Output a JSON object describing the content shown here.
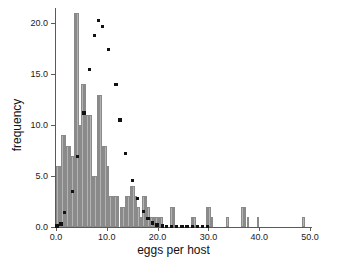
{
  "chart_data": {
    "type": "bar",
    "title": "",
    "subtitle": "",
    "xlabel": "eggs per host",
    "ylabel": "frequency",
    "xlim": [
      0,
      50
    ],
    "ylim": [
      0,
      21.5
    ],
    "xticks": [
      0,
      10,
      20,
      30,
      40,
      50
    ],
    "xtick_labels": [
      "0.0",
      "10.0",
      "20.0",
      "30.0",
      "40.0",
      "50.0"
    ],
    "yticks": [
      0,
      5,
      10,
      15,
      20
    ],
    "ytick_labels": [
      "0.0",
      "5.0",
      "10.0",
      "15.0",
      "20.0"
    ],
    "grid": false,
    "legend": "none",
    "bin_width": 0.5,
    "bar_color": "#b3b3b3",
    "bar_edge_color": "#8a8a8a",
    "point_color": "#111111",
    "series": [
      {
        "name": "observed frequency",
        "type": "bar",
        "x": [
          0.25,
          0.75,
          1.25,
          1.75,
          2.25,
          2.75,
          3.25,
          3.75,
          4.25,
          4.75,
          5.25,
          5.75,
          6.25,
          6.75,
          7.25,
          7.75,
          8.25,
          8.75,
          9.25,
          9.75,
          10.25,
          10.75,
          11.25,
          11.75,
          12.25,
          12.75,
          13.25,
          13.75,
          14.25,
          14.75,
          15.25,
          15.75,
          16.25,
          16.75,
          17.25,
          17.75,
          18.25,
          18.75,
          19.25,
          19.75,
          20.25,
          20.75,
          22.75,
          23.25,
          26.75,
          27.25,
          29.75,
          30.25,
          30.75,
          33.75,
          36.75,
          37.25,
          37.75,
          39.75,
          48.75
        ],
        "values": [
          6,
          6,
          9,
          9,
          8,
          8,
          7,
          21,
          21,
          10,
          14,
          14,
          11,
          11,
          5,
          5,
          13,
          13,
          8,
          8,
          6,
          3,
          3,
          3,
          3,
          2,
          2,
          3,
          3,
          4,
          4,
          3,
          2,
          1,
          3,
          3,
          2,
          1,
          1,
          1,
          1,
          1,
          2,
          2,
          1,
          1,
          2,
          2,
          1,
          1,
          2,
          2,
          1,
          1,
          1
        ]
      },
      {
        "name": "expected (fitted distribution)",
        "type": "scatter",
        "points": [
          {
            "x": 0.2,
            "y": 0.1
          },
          {
            "x": 1.0,
            "y": 0.3
          },
          {
            "x": 1.7,
            "y": 1.4
          },
          {
            "x": 3.2,
            "y": 3.5
          },
          {
            "x": 4.2,
            "y": 6.9
          },
          {
            "x": 5.5,
            "y": 11.2
          },
          {
            "x": 6.6,
            "y": 15.5
          },
          {
            "x": 7.6,
            "y": 18.8
          },
          {
            "x": 8.4,
            "y": 20.3
          },
          {
            "x": 9.2,
            "y": 19.7
          },
          {
            "x": 10.3,
            "y": 17.4
          },
          {
            "x": 11.8,
            "y": 14.0
          },
          {
            "x": 12.6,
            "y": 10.5
          },
          {
            "x": 13.7,
            "y": 7.2
          },
          {
            "x": 15.0,
            "y": 4.6
          },
          {
            "x": 16.1,
            "y": 2.8
          },
          {
            "x": 17.2,
            "y": 1.5
          },
          {
            "x": 18.1,
            "y": 0.8
          },
          {
            "x": 19.0,
            "y": 0.4
          },
          {
            "x": 19.9,
            "y": 0.2
          },
          {
            "x": 20.9,
            "y": 0.1
          },
          {
            "x": 21.8,
            "y": 0.05
          },
          {
            "x": 22.8,
            "y": 0.05
          },
          {
            "x": 23.8,
            "y": 0.05
          },
          {
            "x": 24.8,
            "y": 0.05
          },
          {
            "x": 25.8,
            "y": 0.05
          },
          {
            "x": 26.8,
            "y": 0.05
          },
          {
            "x": 27.8,
            "y": 0.05
          },
          {
            "x": 28.8,
            "y": 0.05
          },
          {
            "x": 29.8,
            "y": 0.05
          }
        ]
      }
    ]
  }
}
